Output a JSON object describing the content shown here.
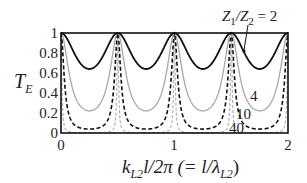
{
  "chart_data": {
    "type": "line",
    "title": "",
    "xlabel": "k_{L2} l / 2π (= l / λ_{L2})",
    "ylabel": "T_E",
    "xlim": [
      0,
      2
    ],
    "ylim": [
      0,
      1
    ],
    "x_ticks": [
      "0",
      "1",
      "2"
    ],
    "y_ticks": [
      "0",
      "0.2",
      "0.4",
      "0.6",
      "0.8",
      "1"
    ],
    "grid": false,
    "legend_position": "inline annotations",
    "formula": "T_E = 1 / (1 + ((r - 1/r)/2)^2 * sin^2(2π x)), r = Z1/Z2",
    "series": [
      {
        "name": "Z1/Z2 = 2",
        "ratio": 2,
        "style": "solid-black",
        "min": 0.64,
        "max": 1,
        "peaks_at_x": [
          0,
          0.5,
          1,
          1.5,
          2
        ]
      },
      {
        "name": "4",
        "ratio": 4,
        "style": "solid-gray",
        "min": 0.22,
        "max": 1,
        "peaks_at_x": [
          0,
          0.5,
          1,
          1.5,
          2
        ]
      },
      {
        "name": "10",
        "ratio": 10,
        "style": "dashed-black",
        "min": 0.04,
        "max": 1,
        "peaks_at_x": [
          0,
          0.5,
          1,
          1.5,
          2
        ]
      },
      {
        "name": "40",
        "ratio": 40,
        "style": "dashed-gray",
        "min": 0.0025,
        "max": 1,
        "peaks_at_x": [
          0,
          0.5,
          1,
          1.5,
          2
        ]
      }
    ],
    "annotations": [
      {
        "text": "Z₁/Z₂ = 2",
        "target": "ratio 2 curve"
      },
      {
        "text": "4"
      },
      {
        "text": "10"
      },
      {
        "text": "40"
      }
    ]
  },
  "labels": {
    "y_axis": "T",
    "y_axis_sub": "E",
    "x_axis_k": "k",
    "x_axis_sub1": "L2",
    "x_axis_rest": "l/2π (= l/λ",
    "x_axis_sub2": "L2",
    "x_axis_close": ")",
    "ann_main": "Z",
    "ann_sub1": "1",
    "ann_slash": "/Z",
    "ann_sub2": "2",
    "ann_eq": " = 2",
    "ann_4": "4",
    "ann_10": "10",
    "ann_40": "40"
  }
}
